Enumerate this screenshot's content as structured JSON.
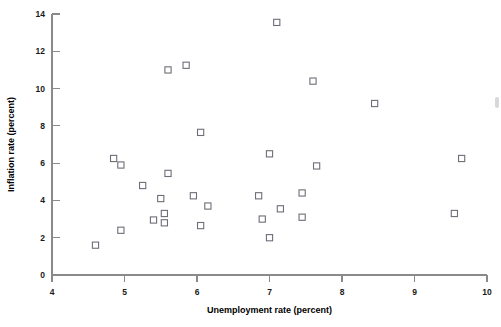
{
  "chart_data": {
    "type": "scatter",
    "title": "",
    "xlabel": "Unemployment rate (percent)",
    "ylabel": "Inflation rate (percent)",
    "xlim": [
      4,
      10
    ],
    "ylim": [
      0,
      14
    ],
    "xticks": [
      4,
      5,
      6,
      7,
      8,
      9,
      10
    ],
    "xtick_labels": [
      "4",
      "5",
      "6",
      "7",
      "8",
      "9",
      "10"
    ],
    "yticks": [
      0,
      2,
      4,
      6,
      8,
      10,
      12,
      14
    ],
    "ytick_labels": [
      "0",
      "2",
      "4",
      "6",
      "8",
      "10",
      "12",
      "14"
    ],
    "grid": false,
    "legend": null,
    "marker": "open-square",
    "marker_color": "#6e6e78",
    "points": [
      {
        "x": 4.6,
        "y": 1.6
      },
      {
        "x": 4.85,
        "y": 6.25
      },
      {
        "x": 4.95,
        "y": 5.9
      },
      {
        "x": 4.95,
        "y": 2.4
      },
      {
        "x": 5.25,
        "y": 4.8
      },
      {
        "x": 5.4,
        "y": 2.95
      },
      {
        "x": 5.5,
        "y": 4.1
      },
      {
        "x": 5.55,
        "y": 3.3
      },
      {
        "x": 5.55,
        "y": 2.8
      },
      {
        "x": 5.6,
        "y": 5.45
      },
      {
        "x": 5.6,
        "y": 11.0
      },
      {
        "x": 5.85,
        "y": 11.25
      },
      {
        "x": 5.95,
        "y": 4.25
      },
      {
        "x": 6.05,
        "y": 7.65
      },
      {
        "x": 6.05,
        "y": 2.65
      },
      {
        "x": 6.15,
        "y": 3.7
      },
      {
        "x": 6.85,
        "y": 4.25
      },
      {
        "x": 6.9,
        "y": 3.0
      },
      {
        "x": 7.0,
        "y": 2.0
      },
      {
        "x": 7.0,
        "y": 6.5
      },
      {
        "x": 7.1,
        "y": 13.55
      },
      {
        "x": 7.15,
        "y": 3.55
      },
      {
        "x": 7.45,
        "y": 4.4
      },
      {
        "x": 7.45,
        "y": 3.1
      },
      {
        "x": 7.6,
        "y": 10.4
      },
      {
        "x": 7.65,
        "y": 5.85
      },
      {
        "x": 8.45,
        "y": 9.2
      },
      {
        "x": 9.55,
        "y": 3.3
      },
      {
        "x": 9.65,
        "y": 6.25
      }
    ]
  },
  "axes": {
    "x_title": "Unemployment rate (percent)",
    "y_title": "Inflation rate (percent)"
  }
}
